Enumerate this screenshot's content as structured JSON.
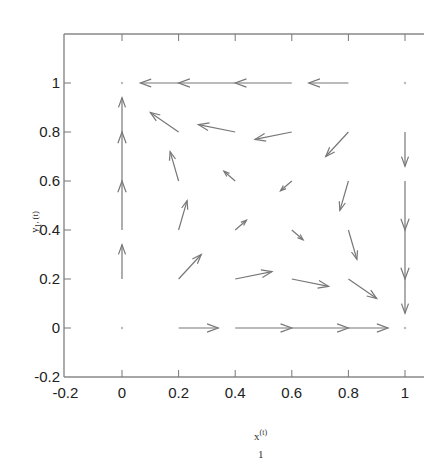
{
  "chart_data": {
    "type": "quiver",
    "title": "",
    "xlabel": "x",
    "xlabel_sup": "(t)",
    "xlabel_sub": "1",
    "ylabel": "y",
    "ylabel_sub": "1",
    "ylabel_suffix": "(t)",
    "xlim": [
      -0.2,
      1.07
    ],
    "ylim": [
      -0.2,
      1.2
    ],
    "xticks": [
      -0.2,
      0,
      0.2,
      0.4,
      0.6,
      0.8,
      1
    ],
    "xtick_labels": [
      "-0.2",
      "0",
      "0.2",
      "0.4",
      "0.6",
      "0.8",
      "1"
    ],
    "yticks": [
      -0.2,
      0,
      0.2,
      0.4,
      0.6,
      0.8,
      1
    ],
    "ytick_labels": [
      "-0.2",
      "0",
      "0.2",
      "0.4",
      "0.6",
      "0.8",
      "1"
    ],
    "grid": false,
    "legend": "none",
    "arrows": [
      {
        "x": 0.2,
        "y": 1,
        "u": -0.135,
        "v": 0
      },
      {
        "x": 0.4,
        "y": 1,
        "u": -0.2,
        "v": 0
      },
      {
        "x": 0.6,
        "y": 1,
        "u": -0.2,
        "v": 0
      },
      {
        "x": 0.8,
        "y": 1,
        "u": -0.14,
        "v": 0
      },
      {
        "x": 0,
        "y": 0.8,
        "u": 0,
        "v": 0.14
      },
      {
        "x": 0,
        "y": 0.6,
        "u": 0,
        "v": 0.2
      },
      {
        "x": 0,
        "y": 0.4,
        "u": 0,
        "v": 0.2
      },
      {
        "x": 0,
        "y": 0.2,
        "u": 0,
        "v": 0.14
      },
      {
        "x": 1,
        "y": 0.8,
        "u": 0,
        "v": -0.14
      },
      {
        "x": 1,
        "y": 0.6,
        "u": 0,
        "v": -0.2
      },
      {
        "x": 1,
        "y": 0.4,
        "u": 0,
        "v": -0.2
      },
      {
        "x": 1,
        "y": 0.2,
        "u": 0,
        "v": -0.14
      },
      {
        "x": 0.2,
        "y": 0,
        "u": 0.14,
        "v": 0
      },
      {
        "x": 0.4,
        "y": 0,
        "u": 0.2,
        "v": 0
      },
      {
        "x": 0.6,
        "y": 0,
        "u": 0.2,
        "v": 0
      },
      {
        "x": 0.8,
        "y": 0,
        "u": 0.14,
        "v": 0
      },
      {
        "x": 0.2,
        "y": 0.8,
        "u": -0.1,
        "v": 0.08
      },
      {
        "x": 0.4,
        "y": 0.8,
        "u": -0.13,
        "v": 0.03
      },
      {
        "x": 0.6,
        "y": 0.8,
        "u": -0.13,
        "v": -0.03
      },
      {
        "x": 0.8,
        "y": 0.8,
        "u": -0.08,
        "v": -0.1
      },
      {
        "x": 0.2,
        "y": 0.6,
        "u": -0.03,
        "v": 0.12
      },
      {
        "x": 0.4,
        "y": 0.6,
        "u": -0.04,
        "v": 0.04
      },
      {
        "x": 0.6,
        "y": 0.6,
        "u": -0.04,
        "v": -0.04
      },
      {
        "x": 0.8,
        "y": 0.6,
        "u": -0.03,
        "v": -0.12
      },
      {
        "x": 0.2,
        "y": 0.4,
        "u": 0.03,
        "v": 0.12
      },
      {
        "x": 0.4,
        "y": 0.4,
        "u": 0.04,
        "v": 0.04
      },
      {
        "x": 0.6,
        "y": 0.4,
        "u": 0.04,
        "v": -0.04
      },
      {
        "x": 0.8,
        "y": 0.4,
        "u": 0.03,
        "v": -0.12
      },
      {
        "x": 0.2,
        "y": 0.2,
        "u": 0.08,
        "v": 0.1
      },
      {
        "x": 0.4,
        "y": 0.2,
        "u": 0.13,
        "v": 0.03
      },
      {
        "x": 0.6,
        "y": 0.2,
        "u": 0.13,
        "v": -0.03
      },
      {
        "x": 0.8,
        "y": 0.2,
        "u": 0.1,
        "v": -0.08
      }
    ],
    "fixed_points": [
      {
        "x": 0,
        "y": 0
      },
      {
        "x": 0,
        "y": 1
      },
      {
        "x": 1,
        "y": 0
      },
      {
        "x": 1,
        "y": 1
      }
    ]
  }
}
